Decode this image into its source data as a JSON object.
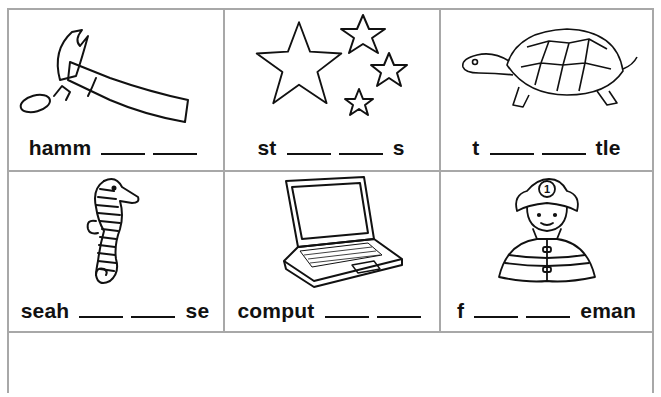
{
  "worksheet": {
    "cells": [
      {
        "picture": "hammer",
        "prefix": "hamm",
        "blanks": 2,
        "suffix": ""
      },
      {
        "picture": "stars",
        "prefix": "st",
        "blanks": 2,
        "suffix": "s"
      },
      {
        "picture": "turtle",
        "prefix": "t",
        "blanks": 2,
        "suffix": "tle"
      },
      {
        "picture": "seahorse",
        "prefix": "seah",
        "blanks": 2,
        "suffix": "se"
      },
      {
        "picture": "computer",
        "prefix": "comput",
        "blanks": 2,
        "suffix": ""
      },
      {
        "picture": "fireman",
        "prefix": "f",
        "blanks": 2,
        "suffix": "eman"
      }
    ],
    "fireman_helmet_number": "1",
    "colors": {
      "border": "#a8a8a8",
      "ink": "#111111",
      "paper": "#ffffff"
    }
  }
}
